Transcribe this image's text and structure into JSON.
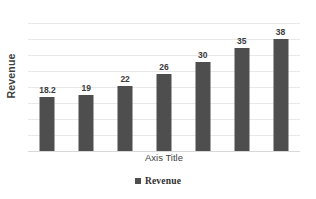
{
  "chart_data": {
    "type": "bar",
    "title": "",
    "subtitle": "",
    "xlabel": "Axis Title",
    "ylabel": "Revenue",
    "categories": [
      "",
      "",
      "",
      "",
      "",
      "",
      ""
    ],
    "values": [
      18.2,
      19,
      22,
      26,
      30,
      35,
      38
    ],
    "value_labels": [
      "18.2",
      "19",
      "22",
      "26",
      "30",
      "35",
      "38"
    ],
    "series": [
      {
        "name": "Revenue",
        "values": [
          18.2,
          19,
          22,
          26,
          30,
          35,
          38
        ],
        "color": "#4e4e4e"
      }
    ],
    "ylim": [
      0,
      43.3
    ],
    "xlim": [
      0,
      7
    ],
    "gridlines": {
      "horizontal": true,
      "vertical": false,
      "count": 9,
      "color": "#e8e8e8"
    },
    "tick_labels": {
      "x": [],
      "y": []
    },
    "legend": {
      "entries": [
        "Revenue"
      ],
      "position": "bottom",
      "marker": "square"
    },
    "data_labels": true,
    "bar_color": "#4e4e4e",
    "background_color": "#ffffff"
  },
  "axes": {
    "y_title": "Revenue",
    "x_title": "Axis Title"
  },
  "legend": {
    "items": [
      {
        "label": "Revenue",
        "color": "#4e4e4e",
        "marker_icon": "square-marker-icon"
      }
    ]
  },
  "colors": {
    "bar": "#4e4e4e",
    "grid": "#e8e8e8",
    "baseline": "#d8d8d8",
    "text": "#3b3b3b",
    "background": "#ffffff"
  }
}
